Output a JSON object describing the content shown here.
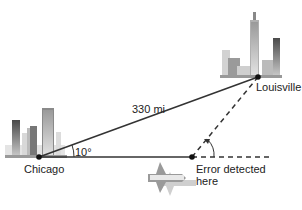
{
  "diagram": {
    "type": "navigation-triangle",
    "labels": {
      "origin": "Chicago",
      "destination": "Louisville",
      "distance": "330 mi",
      "angle": "10°",
      "error_line1": "Error detected",
      "error_line2": "here"
    },
    "colors": {
      "line": "#333333",
      "point": "#111111",
      "building_dark": "#555555",
      "building_light": "#c8c8c8"
    }
  }
}
